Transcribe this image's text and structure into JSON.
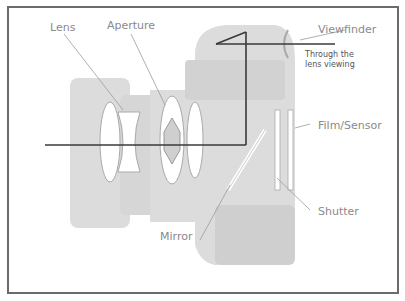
{
  "diagram": {
    "title": "",
    "labels": {
      "lens": "Lens",
      "aperture": "Aperture",
      "viewfinder": "Viewfinder",
      "through_lens_line1": "Through the",
      "through_lens_line2": "lens viewing",
      "film_sensor": "Film/Sensor",
      "shutter": "Shutter",
      "mirror": "Mirror"
    },
    "colors": {
      "frame": "#6b6b6b",
      "camera_body": "#d9d9d9",
      "ray": "#3a3a3a",
      "label": "#8a8a8a",
      "leader": "#9a9a9a"
    }
  }
}
